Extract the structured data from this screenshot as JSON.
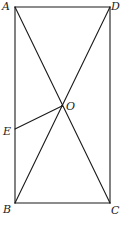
{
  "diagram": {
    "type": "geometry",
    "colors": {
      "stroke": "#1a1a1a",
      "label": "#222222",
      "background": "#ffffff"
    },
    "points": {
      "A": {
        "label": "A",
        "x": 15,
        "y": 7
      },
      "B": {
        "label": "B",
        "x": 15,
        "y": 203
      },
      "C": {
        "label": "C",
        "x": 110,
        "y": 203
      },
      "D": {
        "label": "D",
        "x": 110,
        "y": 7
      },
      "O": {
        "label": "O",
        "x": 62,
        "y": 106
      },
      "E": {
        "label": "E",
        "x": 15,
        "y": 129
      }
    },
    "segments": [
      {
        "name": "AB",
        "from": "A",
        "to": "B"
      },
      {
        "name": "BC",
        "from": "B",
        "to": "C"
      },
      {
        "name": "CD",
        "from": "C",
        "to": "D"
      },
      {
        "name": "DA",
        "from": "D",
        "to": "A"
      },
      {
        "name": "AC",
        "from": "A",
        "to": "C"
      },
      {
        "name": "BD",
        "from": "B",
        "to": "D"
      },
      {
        "name": "OE",
        "from": "O",
        "to": "E"
      }
    ],
    "labels": {
      "A": "A",
      "B": "B",
      "C": "C",
      "D": "D",
      "O": "O",
      "E": "E"
    }
  }
}
